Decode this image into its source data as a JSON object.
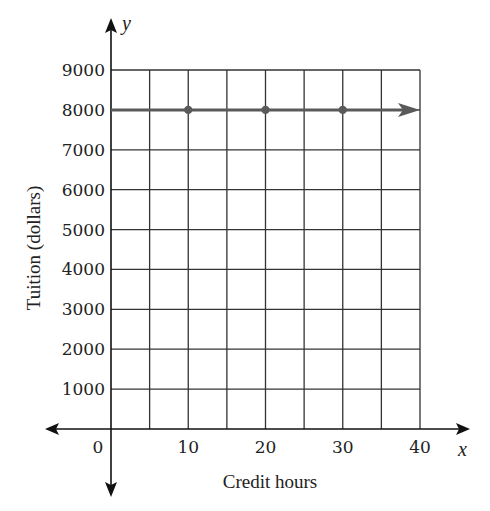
{
  "chart_data": {
    "type": "line",
    "title": "",
    "xlabel": "Credit hours",
    "ylabel": "Tuition (dollars)",
    "x_axis_var": "x",
    "y_axis_var": "y",
    "x_ticks": [
      0,
      10,
      20,
      30,
      40
    ],
    "y_ticks": [
      1000,
      2000,
      3000,
      4000,
      5000,
      6000,
      7000,
      8000,
      9000
    ],
    "xlim": [
      0,
      40
    ],
    "ylim": [
      0,
      9000
    ],
    "grid": true,
    "x_grid_step": 5,
    "y_grid_step": 1000,
    "series": [
      {
        "name": "Tuition",
        "x": [
          0,
          10,
          20,
          30,
          40
        ],
        "values": [
          8000,
          8000,
          8000,
          8000,
          8000
        ],
        "marked_points": [
          [
            10,
            8000
          ],
          [
            20,
            8000
          ],
          [
            30,
            8000
          ]
        ],
        "starts_at_x": 0,
        "arrow_right": true,
        "color": "#555555"
      }
    ],
    "legend": null
  },
  "colors": {
    "grid": "#333333",
    "axis": "#111111",
    "line": "#5a5a5a"
  }
}
